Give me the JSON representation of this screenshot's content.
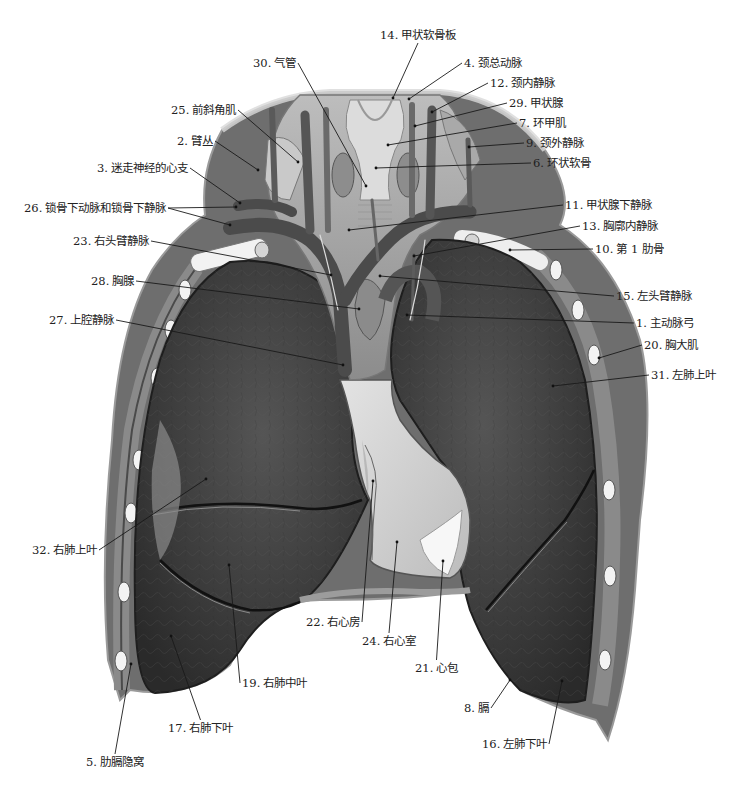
{
  "figure": {
    "colors": {
      "background": "#ffffff",
      "lung": "#3b3b3b",
      "lung_texture": "#4a4a4a",
      "pleura": "#cfcfcf",
      "vessel": "#4d4d4d",
      "bone": "#efefef",
      "label_text": "#222222",
      "leader_line": "#1a1a1a"
    }
  },
  "labels": [
    {
      "id": "1",
      "num": "1.",
      "text": "主动脉弓",
      "x": 636,
      "y": 323,
      "anchor": [
        407,
        315
      ]
    },
    {
      "id": "2",
      "num": "2.",
      "text": "臂丛",
      "x": 177,
      "y": 141,
      "anchor": [
        258,
        170
      ]
    },
    {
      "id": "3",
      "num": "3.",
      "text": "迷走神经的心支",
      "x": 97,
      "y": 168,
      "anchor": [
        240,
        203
      ]
    },
    {
      "id": "4",
      "num": "4.",
      "text": "颈总动脉",
      "x": 464,
      "y": 63,
      "anchor": [
        409,
        99
      ]
    },
    {
      "id": "5",
      "num": "5.",
      "text": "肋膈隐窝",
      "x": 86,
      "y": 762,
      "anchor": [
        131,
        664
      ]
    },
    {
      "id": "6",
      "num": "6.",
      "text": "环状软骨",
      "x": 533,
      "y": 163,
      "anchor": [
        376,
        168
      ]
    },
    {
      "id": "7",
      "num": "7.",
      "text": "环甲肌",
      "x": 519,
      "y": 123,
      "anchor": [
        388,
        145
      ]
    },
    {
      "id": "8",
      "num": "8.",
      "text": "膈",
      "x": 464,
      "y": 708,
      "anchor": [
        510,
        680
      ]
    },
    {
      "id": "9",
      "num": "9.",
      "text": "颈外静脉",
      "x": 526,
      "y": 143,
      "anchor": [
        469,
        147
      ]
    },
    {
      "id": "10",
      "num": "10.",
      "text": "第 1 肋骨",
      "x": 595,
      "y": 249,
      "anchor": [
        510,
        250
      ]
    },
    {
      "id": "11",
      "num": "11.",
      "text": "甲状腺下静脉",
      "x": 565,
      "y": 205,
      "anchor": [
        349,
        230
      ]
    },
    {
      "id": "12",
      "num": "12.",
      "text": "颈内静脉",
      "x": 490,
      "y": 83,
      "anchor": [
        432,
        112
      ]
    },
    {
      "id": "13",
      "num": "13.",
      "text": "胸廓内静脉",
      "x": 582,
      "y": 226,
      "anchor": [
        414,
        256
      ]
    },
    {
      "id": "14",
      "num": "14.",
      "text": "甲状软骨板",
      "x": 380,
      "y": 35,
      "anchor": [
        393,
        98
      ]
    },
    {
      "id": "15",
      "num": "15.",
      "text": "左头臂静脉",
      "x": 616,
      "y": 296,
      "anchor": [
        380,
        276
      ]
    },
    {
      "id": "16",
      "num": "16.",
      "text": "左肺下叶",
      "x": 482,
      "y": 744,
      "anchor": [
        562,
        681
      ]
    },
    {
      "id": "17",
      "num": "17.",
      "text": "右肺下叶",
      "x": 168,
      "y": 728,
      "anchor": [
        171,
        636
      ]
    },
    {
      "id": "19",
      "num": "19.",
      "text": "右肺中叶",
      "x": 242,
      "y": 683,
      "anchor": [
        229,
        565
      ]
    },
    {
      "id": "20",
      "num": "20.",
      "text": "胸大肌",
      "x": 644,
      "y": 345,
      "anchor": [
        599,
        358
      ]
    },
    {
      "id": "21",
      "num": "21.",
      "text": "心包",
      "x": 415,
      "y": 668,
      "anchor": [
        443,
        561
      ]
    },
    {
      "id": "22",
      "num": "22.",
      "text": "右心房",
      "x": 306,
      "y": 622,
      "anchor": [
        373,
        481
      ]
    },
    {
      "id": "23",
      "num": "23.",
      "text": "右头臂静脉",
      "x": 73,
      "y": 241,
      "anchor": [
        331,
        275
      ]
    },
    {
      "id": "24",
      "num": "24.",
      "text": "右心室",
      "x": 362,
      "y": 641,
      "anchor": [
        397,
        542
      ]
    },
    {
      "id": "25",
      "num": "25.",
      "text": "前斜角肌",
      "x": 171,
      "y": 110,
      "anchor": [
        298,
        162
      ]
    },
    {
      "id": "26",
      "num": "26.",
      "text": "锁骨下动脉和锁骨下静脉",
      "x": 24,
      "y": 208,
      "anchor": [
        236,
        207
      ],
      "anchor2": [
        230,
        225
      ]
    },
    {
      "id": "27",
      "num": "27.",
      "text": "上腔静脉",
      "x": 49,
      "y": 320,
      "anchor": [
        343,
        365
      ]
    },
    {
      "id": "28",
      "num": "28.",
      "text": "胸腺",
      "x": 91,
      "y": 281,
      "anchor": [
        359,
        309
      ]
    },
    {
      "id": "29",
      "num": "29.",
      "text": "甲状腺",
      "x": 509,
      "y": 103,
      "anchor": [
        415,
        126
      ]
    },
    {
      "id": "30",
      "num": "30.",
      "text": "气管",
      "x": 253,
      "y": 63,
      "anchor": [
        366,
        186
      ]
    },
    {
      "id": "31",
      "num": "31.",
      "text": "左肺上叶",
      "x": 651,
      "y": 375,
      "anchor": [
        553,
        386
      ]
    },
    {
      "id": "32",
      "num": "32.",
      "text": "右肺上叶",
      "x": 32,
      "y": 550,
      "anchor": [
        206,
        479
      ]
    }
  ]
}
